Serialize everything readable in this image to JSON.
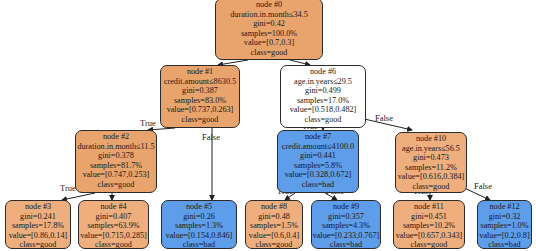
{
  "tree": {
    "nodes": [
      {
        "id": "node #0",
        "condition": "duration.in.month≤34.5",
        "gini": "gini=0.42",
        "samples": "samples=100.0%",
        "value": "value=[0.7,0.3]",
        "class": "class=good"
      },
      {
        "id": "node #1",
        "condition": "credit.amount≤8630.5",
        "gini": "gini=0.387",
        "samples": "samples=83.0%",
        "value": "value=[0.737,0.263]",
        "class": "class=good"
      },
      {
        "id": "node #2",
        "condition": "duration.in.month≤11.5",
        "gini": "gini=0.378",
        "samples": "samples=81.7%",
        "value": "value=[0.747,0.253]",
        "class": "class=good"
      },
      {
        "id": "node #3",
        "gini": "gini=0.241",
        "samples": "samples=17.8%",
        "value": "value=[0.86,0.14]",
        "class": "class=good"
      },
      {
        "id": "node #4",
        "gini": "gini=0.407",
        "samples": "samples=63.9%",
        "value": "value=[0.715,0.285]",
        "class": "class=good"
      },
      {
        "id": "node #5",
        "gini": "gini=0.26",
        "samples": "samples=1.3%",
        "value": "value=[0.154,0.846]",
        "class": "class=bad"
      },
      {
        "id": "node #6",
        "condition": "age.in.years≤29.5",
        "gini": "gini=0.499",
        "samples": "samples=17.0%",
        "value": "value=[0.518,0.482]",
        "class": "class=good"
      },
      {
        "id": "node #7",
        "condition": "credit.amount≤4100.0",
        "gini": "gini=0.441",
        "samples": "samples=5.8%",
        "value": "value=[0.328,0.672]",
        "class": "class=bad"
      },
      {
        "id": "node #8",
        "gini": "gini=0.48",
        "samples": "samples=1.5%",
        "value": "value=[0.6,0.4]",
        "class": "class=good"
      },
      {
        "id": "node #9",
        "gini": "gini=0.357",
        "samples": "samples=4.3%",
        "value": "value=[0.233,0.767]",
        "class": "class=bad"
      },
      {
        "id": "node #10",
        "condition": "age.in.years≤56.5",
        "gini": "gini=0.473",
        "samples": "samples=11.2%",
        "value": "value=[0.616,0.384]",
        "class": "class=good"
      },
      {
        "id": "node #11",
        "gini": "gini=0.451",
        "samples": "samples=10.2%",
        "value": "value=[0.657,0.343]",
        "class": "class=good"
      },
      {
        "id": "node #12",
        "gini": "gini=0.32",
        "samples": "samples=1.0%",
        "value": "value=[0.2,0.8]",
        "class": "class=bad"
      }
    ],
    "edge_labels": {
      "true": "True",
      "false": "False"
    },
    "colors": {
      "good": "#e9a46d",
      "bad": "#5e9de9",
      "neutral": "#ffffff"
    }
  }
}
